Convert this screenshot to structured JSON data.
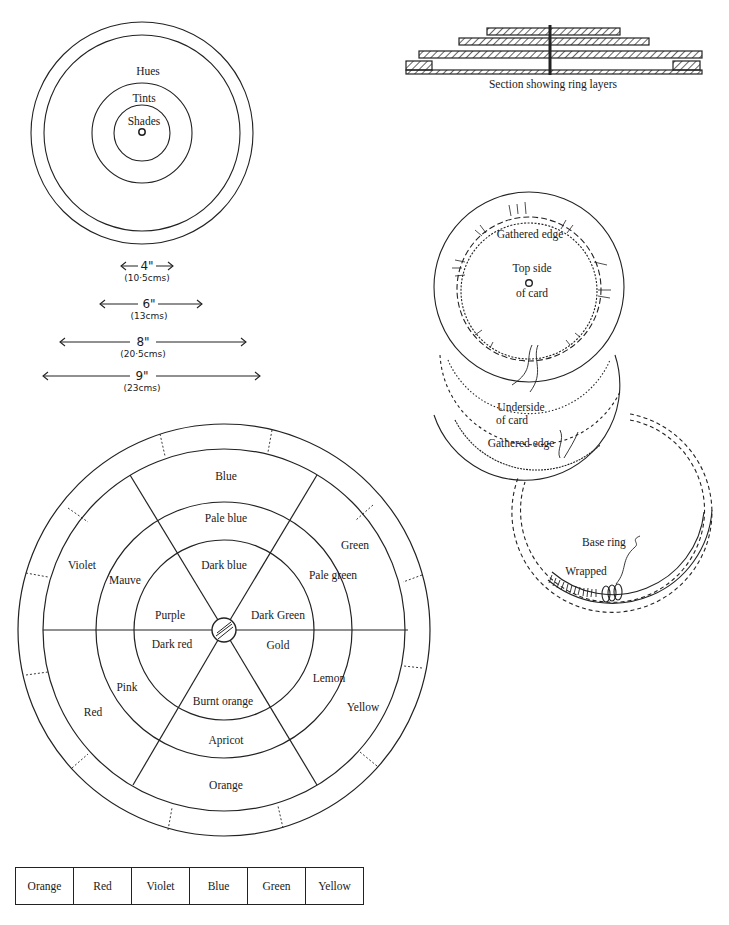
{
  "concentric_diagram": {
    "labels": {
      "outer": "Hues",
      "middle": "Tints",
      "inner": "Shades"
    }
  },
  "ring_sizes": [
    {
      "inches": "4\"",
      "cms": "(10·5cms)"
    },
    {
      "inches": "6\"",
      "cms": "(13cms)"
    },
    {
      "inches": "8\"",
      "cms": "(20·5cms)"
    },
    {
      "inches": "9\"",
      "cms": "(23cms)"
    }
  ],
  "section": {
    "caption": "Section showing ring layers"
  },
  "card_diagram": {
    "top_gathered_edge": "Gathered edge",
    "top_side_line1": "Top side",
    "top_side_line2": "of card",
    "underside_line1": "Underside",
    "underside_line2": "of card",
    "bottom_gathered_edge": "Gathered edge",
    "base_ring": "Base ring",
    "wrapped": "Wrapped"
  },
  "color_wheel": {
    "hues": [
      "Blue",
      "Green",
      "Yellow",
      "Orange",
      "Red",
      "Violet"
    ],
    "tints": [
      "Pale blue",
      "Pale green",
      "Lemon",
      "Apricot",
      "Pink",
      "Mauve"
    ],
    "shades": [
      "Dark blue",
      "Dark Green",
      "Gold",
      "Burnt orange",
      "Dark red",
      "Purple"
    ]
  },
  "color_strip": [
    "Orange",
    "Red",
    "Violet",
    "Blue",
    "Green",
    "Yellow"
  ]
}
